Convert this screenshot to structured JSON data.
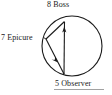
{
  "figure": {
    "kind": "circle-inscribed-triangle-diagram",
    "background_color": "#ffffff",
    "stroke_color": "#1a1a1a",
    "labels": {
      "top": "8 Boss",
      "left": "7 Epicure",
      "bottom": "5 Observer"
    },
    "nodes": [
      {
        "name": "Boss",
        "number": "8",
        "label": "8 Boss",
        "position": "top"
      },
      {
        "name": "Epicure",
        "number": "7",
        "label": "7 Epicure",
        "position": "left"
      },
      {
        "name": "Observer",
        "number": "5",
        "label": "5 Observer",
        "position": "bottom"
      }
    ],
    "circle": {
      "center_x": 72,
      "center_y": 46,
      "radius": 30
    },
    "vertices": {
      "boss": {
        "x": 64,
        "y": 21
      },
      "epicure": {
        "x": 46,
        "y": 39
      },
      "observer": {
        "x": 64,
        "y": 74
      }
    },
    "arrows": [
      {
        "from": "Observer",
        "to": "Boss",
        "direction": "up"
      },
      {
        "from": "Boss",
        "to": "Epicure",
        "direction": "down-left"
      },
      {
        "from": "Epicure",
        "to": "Observer",
        "direction": "down-right"
      }
    ]
  }
}
